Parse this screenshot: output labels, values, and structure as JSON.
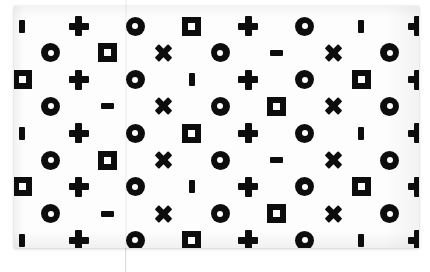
{
  "sheet": {
    "title": "Symbol pattern sheet",
    "background_color": "#ffffff",
    "paper_color": "#fdfdfd",
    "ink_color": "#0d0d0d",
    "paper_rect": {
      "x": 14,
      "y": 6,
      "width": 405,
      "height": 242
    },
    "fold_line_x": 125,
    "rows": 9,
    "columns": 8
  },
  "legend": {
    "bar": "vertical-bar-symbol",
    "plus": "plus-symbol",
    "circle": "donut-circle-symbol",
    "square": "holed-square-symbol",
    "x": "x-cross-symbol",
    "dash": "horizontal-dash-symbol",
    "halfcircle": "clipped-circle-symbol"
  },
  "pattern": {
    "row_a": [
      "bar",
      "plus",
      "circle",
      "square",
      "plus",
      "circle",
      "bar",
      "plus"
    ],
    "row_b": [
      "circle",
      "circle",
      "square",
      "x",
      "circle",
      "dash",
      "x",
      "circle"
    ],
    "row_c": [
      "square",
      "plus",
      "circle",
      "bar",
      "plus",
      "circle",
      "square",
      "plus"
    ],
    "row_d": [
      "circle",
      "circle",
      "dash",
      "x",
      "circle",
      "square",
      "x",
      "circle"
    ],
    "row_sequence": [
      "row_a",
      "row_b",
      "row_c",
      "row_d",
      "row_a",
      "row_b",
      "row_c",
      "row_d",
      "row_a"
    ]
  },
  "grid": {
    "origin_x": 22,
    "origin_y": 26,
    "step_x": 56.5,
    "step_y": 26.8,
    "row_offsets": [
      0,
      -28,
      0,
      -28,
      0,
      -28,
      0,
      -28,
      0
    ]
  },
  "symbol_sizes": {
    "bar": {
      "w": 6,
      "h": 13
    },
    "dash": {
      "w": 13,
      "h": 6
    },
    "square": {
      "outer": 19,
      "inner": 7
    },
    "circle": {
      "outer": 19,
      "inner": 6
    },
    "plus": {
      "span": 20,
      "thickness": 7
    },
    "x": {
      "span": 19,
      "thickness": 6
    }
  }
}
